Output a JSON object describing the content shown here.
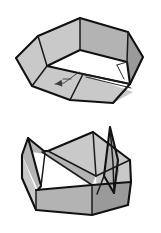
{
  "document": {
    "kind": "geometric-line-drawing",
    "title": "Folded polyhedral box — two views",
    "background_color": "#ffffff",
    "stroke_color": "#111111",
    "palette": {
      "face_light": "#c9c9c9",
      "face_mid": "#b3b3b3",
      "face_dark": "#9a9a9a",
      "face_white": "#ffffff",
      "outline": "#111111"
    }
  },
  "figures": [
    {
      "id": "upper-figure",
      "label": "open hexagonal folded box, upper view",
      "description": "Six-sided open box with upswept wall panels and a creased, partially folded floor; a small arrow annotation marks a fold direction near the centre.",
      "bounds": {
        "x": 10,
        "y": 8,
        "width": 140,
        "height": 105
      },
      "faces": [
        {
          "name": "wall-back-left",
          "shade": "face-light",
          "points": "38,36 80,18 80,50 47,66"
        },
        {
          "name": "wall-back-right",
          "shade": "face-mid",
          "points": "80,18 128,32 127,62 80,50"
        },
        {
          "name": "wall-left",
          "shade": "face-light",
          "points": "16,58 38,36 47,66 32,86"
        },
        {
          "name": "wall-right",
          "shade": "face-dark",
          "points": "128,32 143,57 130,84 127,62"
        },
        {
          "name": "floor-left-flap",
          "shade": "face-light",
          "points": "32,86 47,66 83,74 70,100"
        },
        {
          "name": "floor-front-flap",
          "shade": "face-light",
          "points": "70,100 83,74 133,92 113,103"
        },
        {
          "name": "floor-crease-w",
          "shade": "face-white",
          "points": "83,74 127,62 130,84"
        },
        {
          "name": "floor-notch-w",
          "shade": "face-white",
          "points": "118,66 127,62 124,78"
        }
      ],
      "edges": [
        {
          "name": "rim-outline",
          "weight": "outer",
          "points": "16,58 38,36 80,18 128,32 143,57 130,84 113,103 70,100 32,86 16,58"
        },
        {
          "name": "rim-inner",
          "weight": "outer",
          "points": "47,66 80,50 127,62 130,84 83,74 47,66"
        },
        {
          "name": "fold-left-upper",
          "weight": "inner",
          "points": "38,36 47,66"
        },
        {
          "name": "fold-mid-upper",
          "weight": "inner",
          "points": "80,18 80,50"
        },
        {
          "name": "fold-right-upper",
          "weight": "inner",
          "points": "128,32 127,62"
        },
        {
          "name": "fold-left-lower",
          "weight": "inner",
          "points": "32,86 47,66"
        },
        {
          "name": "fold-floor-diag",
          "weight": "inner",
          "points": "83,74 70,100"
        },
        {
          "name": "fold-floor-right",
          "weight": "inner",
          "points": "83,74 130,84"
        },
        {
          "name": "fold-right-lower",
          "weight": "inner",
          "points": "130,84 113,103"
        },
        {
          "name": "crease-thin",
          "weight": "thin",
          "points": "118,66 127,62"
        },
        {
          "name": "crease-notch",
          "weight": "thin",
          "points": "118,66 124,78"
        },
        {
          "name": "crease-double",
          "weight": "thin",
          "points": "86,77 131,88"
        }
      ],
      "annotation": {
        "name": "fold-direction-arrow",
        "type": "arrow",
        "from": {
          "x": 79,
          "y": 72
        },
        "to": {
          "x": 55,
          "y": 84
        },
        "tail_kink": {
          "x": 64,
          "y": 83
        }
      }
    },
    {
      "id": "lower-figure",
      "label": "closed box with raised corner tabs, lower view",
      "description": "Square-based open box seen from above-front; two pointed corner tabs stand up at left and right, with creased inner floor panels.",
      "bounds": {
        "x": 14,
        "y": 124,
        "width": 130,
        "height": 105
      },
      "faces": [
        {
          "name": "inner-floor-back",
          "shade": "face-light",
          "points": "48,151 93,132 130,160 96,176"
        },
        {
          "name": "inner-floor-left",
          "shade": "face-mid",
          "points": "42,152 48,151 96,176 92,185"
        },
        {
          "name": "inner-wall-right",
          "shade": "face-light",
          "points": "96,176 130,160 131,182 97,194"
        },
        {
          "name": "front-wall",
          "shade": "face-mid",
          "points": "36,190 92,185 92,215 36,210"
        },
        {
          "name": "front-wall-right",
          "shade": "face-dark",
          "points": "92,185 131,182 128,205 92,215"
        },
        {
          "name": "side-wall-left",
          "shade": "face-light",
          "points": "22,155 36,190 36,210 22,178"
        },
        {
          "name": "tab-left-outer",
          "shade": "face-mid",
          "points": "28,138 44,151 38,190 22,155"
        },
        {
          "name": "tab-left-inner-w",
          "shade": "face-white",
          "points": "32,152 45,153 41,186"
        },
        {
          "name": "tab-right",
          "shade": "face-mid",
          "points": "110,127 118,160 114,193 104,176"
        },
        {
          "name": "tab-right-edge",
          "shade": "face-dark",
          "points": "110,127 118,160 114,193 119,170"
        }
      ],
      "edges": [
        {
          "name": "box-outline",
          "weight": "outer",
          "points": "22,155 28,138 44,151 48,151 93,132 130,160 131,182 128,205 92,215 36,210 22,178 22,155"
        },
        {
          "name": "tab-left-profile",
          "weight": "outer",
          "points": "28,138 32,152 41,186 38,190"
        },
        {
          "name": "tab-left-crease",
          "weight": "inner",
          "points": "44,151 45,153 41,186"
        },
        {
          "name": "tab-right-profile",
          "weight": "outer",
          "points": "110,127 104,176 114,193 118,160 110,127"
        },
        {
          "name": "tab-right-crease",
          "weight": "inner",
          "points": "110,127 113,163 114,193"
        },
        {
          "name": "floor-crease-a",
          "weight": "inner",
          "points": "48,151 96,176"
        },
        {
          "name": "floor-crease-b",
          "weight": "inner",
          "points": "42,152 92,185"
        },
        {
          "name": "floor-crease-c",
          "weight": "inner",
          "points": "93,132 96,176"
        },
        {
          "name": "floor-crease-d",
          "weight": "inner",
          "points": "96,176 130,160"
        },
        {
          "name": "rim-front",
          "weight": "outer",
          "points": "36,190 92,185 131,182"
        },
        {
          "name": "corner-left",
          "weight": "inner",
          "points": "36,190 36,210"
        },
        {
          "name": "corner-mid",
          "weight": "inner",
          "points": "92,185 92,215"
        },
        {
          "name": "wall-right-fold",
          "weight": "inner",
          "points": "97,194 104,176"
        }
      ]
    }
  ]
}
